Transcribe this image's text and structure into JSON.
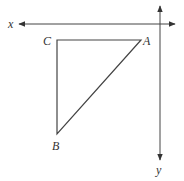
{
  "diagram": {
    "axes": {
      "x_label": "x",
      "y_label": "y",
      "x_direction": "left",
      "y_direction": "down"
    },
    "triangle": {
      "vertices": [
        {
          "name": "C",
          "label": "C",
          "position": "top-left"
        },
        {
          "name": "A",
          "label": "A",
          "position": "top-right"
        },
        {
          "name": "B",
          "label": "B",
          "position": "bottom-left"
        }
      ],
      "right_angle_at": "C"
    },
    "colors": {
      "line": "#444444",
      "background": "#ffffff"
    }
  }
}
